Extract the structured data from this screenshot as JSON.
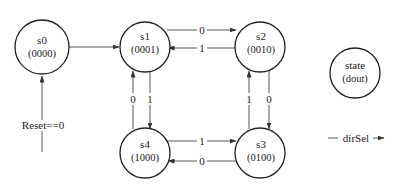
{
  "diagram": {
    "type": "state-machine",
    "states": [
      {
        "id": "s0",
        "name": "s0",
        "output": "(0000)"
      },
      {
        "id": "s1",
        "name": "s1",
        "output": "(0001)"
      },
      {
        "id": "s2",
        "name": "s2",
        "output": "(0010)"
      },
      {
        "id": "s3",
        "name": "s3",
        "output": "(0100)"
      },
      {
        "id": "s4",
        "name": "s4",
        "output": "(1000)"
      }
    ],
    "reset": {
      "label": "Reset==0",
      "target": "s0"
    },
    "transitions": [
      {
        "from": "s0",
        "to": "s1",
        "label": ""
      },
      {
        "from": "s1",
        "to": "s2",
        "label": "0"
      },
      {
        "from": "s2",
        "to": "s1",
        "label": "1"
      },
      {
        "from": "s2",
        "to": "s3",
        "label": "0"
      },
      {
        "from": "s3",
        "to": "s2",
        "label": "1"
      },
      {
        "from": "s4",
        "to": "s3",
        "label": "1"
      },
      {
        "from": "s3",
        "to": "s4",
        "label": "0"
      },
      {
        "from": "s1",
        "to": "s4",
        "label": "1"
      },
      {
        "from": "s4",
        "to": "s1",
        "label": "0"
      }
    ],
    "legend": {
      "state_label": "state",
      "output_label": "(dout)",
      "input_label": "dirSel"
    }
  }
}
